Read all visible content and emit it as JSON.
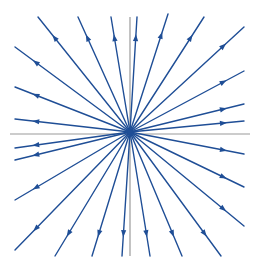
{
  "diagram": {
    "title": "",
    "background": "#ffffff",
    "line_color": "#1f4e96",
    "axis_color": "#9a9a9a",
    "center": [
      130,
      132
    ],
    "axes": {
      "horizontal": {
        "x1": 10,
        "y1": 134,
        "x2": 250,
        "y2": 134
      },
      "vertical": {
        "x1": 130,
        "y1": 17,
        "x2": 130,
        "y2": 256
      }
    },
    "rays": [
      {
        "end": [
          38,
          17
        ]
      },
      {
        "end": [
          78,
          17
        ]
      },
      {
        "end": [
          111,
          17
        ]
      },
      {
        "end": [
          137,
          17
        ]
      },
      {
        "end": [
          168,
          14
        ]
      },
      {
        "end": [
          204,
          17
        ]
      },
      {
        "end": [
          244,
          27
        ]
      },
      {
        "end": [
          244,
          71
        ]
      },
      {
        "end": [
          244,
          104
        ]
      },
      {
        "end": [
          244,
          121
        ]
      },
      {
        "end": [
          244,
          154
        ]
      },
      {
        "end": [
          244,
          187
        ]
      },
      {
        "end": [
          244,
          226
        ]
      },
      {
        "end": [
          221,
          256
        ]
      },
      {
        "end": [
          182,
          256
        ]
      },
      {
        "end": [
          150,
          256
        ]
      },
      {
        "end": [
          122,
          256
        ]
      },
      {
        "end": [
          92,
          256
        ]
      },
      {
        "end": [
          55,
          256
        ]
      },
      {
        "end": [
          15,
          250
        ]
      },
      {
        "end": [
          15,
          200
        ]
      },
      {
        "end": [
          15,
          160
        ]
      },
      {
        "end": [
          15,
          148
        ]
      },
      {
        "end": [
          15,
          119
        ]
      },
      {
        "end": [
          15,
          87
        ]
      },
      {
        "end": [
          15,
          47
        ]
      }
    ],
    "arrow_direction": "outward",
    "arrow_position_fraction": 0.82
  }
}
